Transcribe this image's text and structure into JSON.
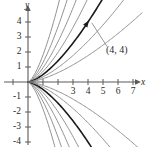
{
  "figure": {
    "name": "family-of-curves-through-origin",
    "background_color": "#ffffff",
    "axis_color": "#5a5a5a",
    "curve_color": "#8c8c8c",
    "highlight_curve_color": "#1a1a1a",
    "text_color": "#2b2b2b"
  },
  "axes": {
    "x_axis_label": "x",
    "y_axis_label": "y",
    "x_ticks": [
      {
        "value": -1,
        "label": ""
      },
      {
        "value": 1,
        "label": ""
      },
      {
        "value": 2,
        "label": ""
      },
      {
        "value": 3,
        "label": "3"
      },
      {
        "value": 4,
        "label": "4"
      },
      {
        "value": 5,
        "label": "5"
      },
      {
        "value": 6,
        "label": "6"
      },
      {
        "value": 7,
        "label": "7"
      }
    ],
    "y_ticks": [
      {
        "value": 4,
        "label": "4"
      },
      {
        "value": 3,
        "label": "3"
      },
      {
        "value": 2,
        "label": "2"
      },
      {
        "value": 1,
        "label": "1"
      },
      {
        "value": -1,
        "label": "-1"
      },
      {
        "value": -2,
        "label": "-2"
      },
      {
        "value": -3,
        "label": "-3"
      },
      {
        "value": -4,
        "label": "-4"
      }
    ],
    "xlim": [
      -1.6,
      8.0
    ],
    "ylim": [
      -4.8,
      4.8
    ],
    "origin_label": ""
  },
  "annotations": [
    {
      "name": "point-label-4-4",
      "text": "(4, 4)",
      "x": 5.2,
      "y": 2.1,
      "leader_from": [
        4.25,
        3.95
      ]
    }
  ],
  "chart_data": {
    "type": "line",
    "title": "",
    "subtitle": "",
    "xlabel": "x",
    "ylabel": "y",
    "xlim": [
      -1.6,
      8.0
    ],
    "ylim": [
      -4.8,
      4.8
    ],
    "grid": false,
    "legend": "none",
    "family_form": "y = k*x^(3/2)",
    "x_domain": [
      0,
      7.6
    ],
    "series": [
      {
        "name": "k=1.80",
        "k": 1.8,
        "emphasis": "normal",
        "color": "#8c8c8c"
      },
      {
        "name": "k=1.30",
        "k": 1.3,
        "emphasis": "normal",
        "color": "#8c8c8c"
      },
      {
        "name": "k=0.95",
        "k": 0.95,
        "emphasis": "normal",
        "color": "#8c8c8c"
      },
      {
        "name": "k=0.70",
        "k": 0.7,
        "emphasis": "normal",
        "color": "#8c8c8c"
      },
      {
        "name": "k=0.50",
        "k": 0.5,
        "emphasis": "highlight",
        "color": "#1a1a1a",
        "passes_through": [
          4,
          4
        ]
      },
      {
        "name": "k=0.34",
        "k": 0.34,
        "emphasis": "normal",
        "color": "#8c8c8c"
      },
      {
        "name": "k=0.22",
        "k": 0.22,
        "emphasis": "normal",
        "color": "#8c8c8c"
      },
      {
        "name": "k=-1.80",
        "k": -1.8,
        "emphasis": "normal",
        "color": "#8c8c8c"
      },
      {
        "name": "k=-1.30",
        "k": -1.3,
        "emphasis": "normal",
        "color": "#8c8c8c"
      },
      {
        "name": "k=-0.95",
        "k": -0.95,
        "emphasis": "normal",
        "color": "#8c8c8c"
      },
      {
        "name": "k=-0.70",
        "k": -0.7,
        "emphasis": "normal",
        "color": "#8c8c8c"
      },
      {
        "name": "k=-0.50",
        "k": -0.5,
        "emphasis": "highlight",
        "color": "#1a1a1a"
      },
      {
        "name": "k=-0.34",
        "k": -0.34,
        "emphasis": "normal",
        "color": "#8c8c8c"
      },
      {
        "name": "k=-0.22",
        "k": -0.22,
        "emphasis": "normal",
        "color": "#8c8c8c"
      }
    ],
    "marked_points": [
      {
        "label": "(4, 4)",
        "x": 4,
        "y": 4
      }
    ]
  }
}
